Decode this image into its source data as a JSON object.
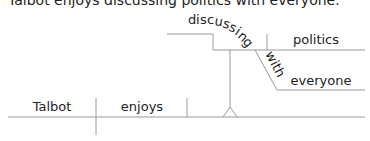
{
  "sentence": "Talbot enjoys discussing politics with everyone.",
  "diagram": {
    "subject": "Talbot",
    "verb": "enjoys",
    "gerund_chars": [
      "d",
      "i",
      "s",
      "c",
      "u",
      "s",
      "s",
      "i",
      "n",
      "g"
    ],
    "gerund": "discussing",
    "object": "politics",
    "preposition": "with",
    "prep_object": "everyone"
  },
  "colors": {
    "line": "#9a9a9a",
    "text": "#222222"
  }
}
